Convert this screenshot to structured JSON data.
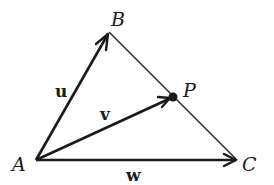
{
  "diagram": {
    "type": "vector-triangle",
    "colors": {
      "background": "#ffffff",
      "stroke": "#1a1a1a"
    },
    "points": {
      "A": {
        "label": "A",
        "x": 36,
        "y": 160
      },
      "B": {
        "label": "B",
        "x": 109,
        "y": 32
      },
      "C": {
        "label": "C",
        "x": 237,
        "y": 160
      },
      "P": {
        "label": "P",
        "x": 173,
        "y": 97
      }
    },
    "vectors": [
      {
        "name": "u",
        "label": "u",
        "from": "A",
        "to": "B"
      },
      {
        "name": "v",
        "label": "v",
        "from": "A",
        "to": "P"
      },
      {
        "name": "w",
        "label": "w",
        "from": "A",
        "to": "C"
      }
    ],
    "segments": [
      {
        "from": "B",
        "to": "C",
        "note": "thin line through P"
      }
    ]
  }
}
